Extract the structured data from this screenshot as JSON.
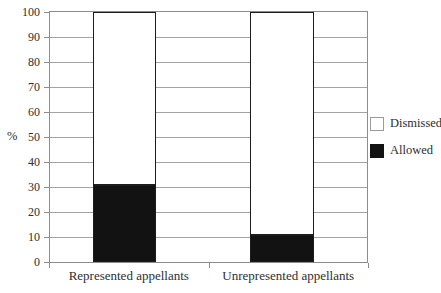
{
  "chart_data": {
    "type": "bar",
    "stacked": true,
    "categories": [
      "Represented appellants",
      "Unrepresented appellants"
    ],
    "series": [
      {
        "name": "Dismissed",
        "values": [
          69,
          89
        ],
        "color": "#ffffff",
        "swatch_border": "#9b9b9b"
      },
      {
        "name": "Allowed",
        "values": [
          31,
          11
        ],
        "color": "#121212",
        "swatch_border": "#121212"
      }
    ],
    "stack_bottom_to_top": [
      "Allowed",
      "Dismissed"
    ],
    "ylabel": "%",
    "ylim": [
      0,
      100
    ],
    "ytick_step": 10,
    "yticks": [
      0,
      10,
      20,
      30,
      40,
      50,
      60,
      70,
      80,
      90,
      100
    ],
    "grid": true,
    "legend_position": "right"
  },
  "colors": {
    "background": "#ffffff",
    "grid_line": "#a3a3a3",
    "frame": "#8c8c8c",
    "bar_border": "#1c1c1c",
    "text": "#2e2e2e"
  }
}
